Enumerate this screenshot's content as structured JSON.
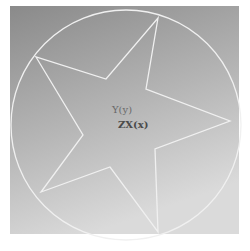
{
  "viewport": {
    "frame": {
      "x": 10,
      "y": 6,
      "width": 106,
      "height": 230
    },
    "background_top": "#8e8e8e",
    "background_bottom": "#d4d4d4",
    "border_color": "#f4f4f4",
    "line_color": "#f0f0f0"
  },
  "circle": {
    "cx": 126,
    "cy": 125,
    "r": 115
  },
  "star": {
    "points": "158,18 146,89 230,121 155,149 158,232 110,167 41,192 83,135 36,57 106,79"
  },
  "labels": {
    "y_axis": "Y(y)",
    "zx_axis": "ZX(x)"
  }
}
